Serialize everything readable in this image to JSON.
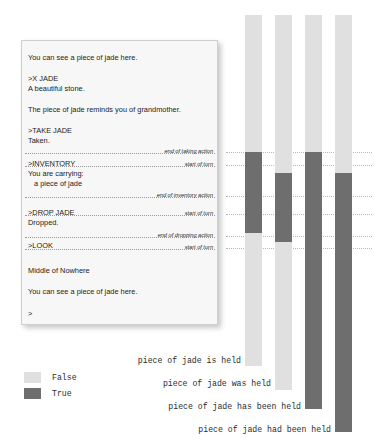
{
  "transcript": {
    "lines": [
      {
        "text": "You can see a piece of jade here.",
        "y": 12,
        "indent": false
      },
      {
        "text": ">X JADE",
        "y": 33,
        "indent": false
      },
      {
        "text": "A beautiful stone.",
        "y": 43,
        "indent": false
      },
      {
        "text": "The piece of jade reminds you of grandmother.",
        "y": 64,
        "indent": false
      },
      {
        "text": ">TAKE JADE",
        "y": 85,
        "indent": false
      },
      {
        "text": "Taken.",
        "y": 95,
        "indent": false
      },
      {
        "text": ">INVENTORY",
        "y": 118,
        "indent": false
      },
      {
        "text": "You are carrying:",
        "y": 128,
        "indent": false
      },
      {
        "text": "a piece of jade",
        "y": 138,
        "indent": true
      },
      {
        "text": ">DROP JADE",
        "y": 167,
        "indent": false
      },
      {
        "text": "Dropped.",
        "y": 177,
        "indent": false
      },
      {
        "text": ">LOOK",
        "y": 200,
        "indent": false
      },
      {
        "text": "Middle of Nowhere",
        "y": 225,
        "indent": false
      },
      {
        "text": "You can see a piece of jade here.",
        "y": 246,
        "indent": false
      },
      {
        "text": ">",
        "y": 268,
        "indent": false
      }
    ],
    "events": [
      {
        "caption": "end of taking action",
        "y": 104
      },
      {
        "caption": "start of turn",
        "y": 117
      },
      {
        "caption": "end of inventory action",
        "y": 148
      },
      {
        "caption": "start of turn",
        "y": 166
      },
      {
        "caption": "end of dropping action",
        "y": 188
      },
      {
        "caption": "start of turn",
        "y": 200
      }
    ]
  },
  "chart_data": {
    "type": "bar",
    "title": "",
    "xlabel": "",
    "ylabel": "",
    "grid": true,
    "legend_position": "bottom-left",
    "legend": [
      {
        "label": "False",
        "color": "#e0e0e0"
      },
      {
        "label": "True",
        "color": "#6e6e6e"
      }
    ],
    "colors": {
      "false": "#e0e0e0",
      "true": "#6e6e6e"
    },
    "gridlines_y": [
      152,
      165,
      196,
      214,
      236,
      248
    ],
    "axis_top": 15,
    "categories": [
      "piece of jade is held",
      "piece of jade was held",
      "piece of jade has been held",
      "piece of jade had been held"
    ],
    "series": [
      {
        "name": "piece of jade is held",
        "x": 245,
        "top": 15,
        "bottom": 366,
        "label_y": 360,
        "segments": [
          {
            "value": "False",
            "from": 15,
            "to": 152
          },
          {
            "value": "True",
            "from": 152,
            "to": 233
          },
          {
            "value": "False",
            "from": 233,
            "to": 366
          }
        ]
      },
      {
        "name": "piece of jade was held",
        "x": 275,
        "top": 15,
        "bottom": 390,
        "label_y": 383,
        "segments": [
          {
            "value": "False",
            "from": 15,
            "to": 173
          },
          {
            "value": "True",
            "from": 173,
            "to": 242
          },
          {
            "value": "False",
            "from": 242,
            "to": 390
          }
        ]
      },
      {
        "name": "piece of jade has been held",
        "x": 305,
        "top": 15,
        "bottom": 409,
        "label_y": 406,
        "segments": [
          {
            "value": "False",
            "from": 15,
            "to": 152
          },
          {
            "value": "True",
            "from": 152,
            "to": 409
          }
        ]
      },
      {
        "name": "piece of jade had been held",
        "x": 335,
        "top": 15,
        "bottom": 432,
        "label_y": 429,
        "segments": [
          {
            "value": "False",
            "from": 15,
            "to": 173
          },
          {
            "value": "True",
            "from": 173,
            "to": 432
          }
        ]
      }
    ]
  }
}
